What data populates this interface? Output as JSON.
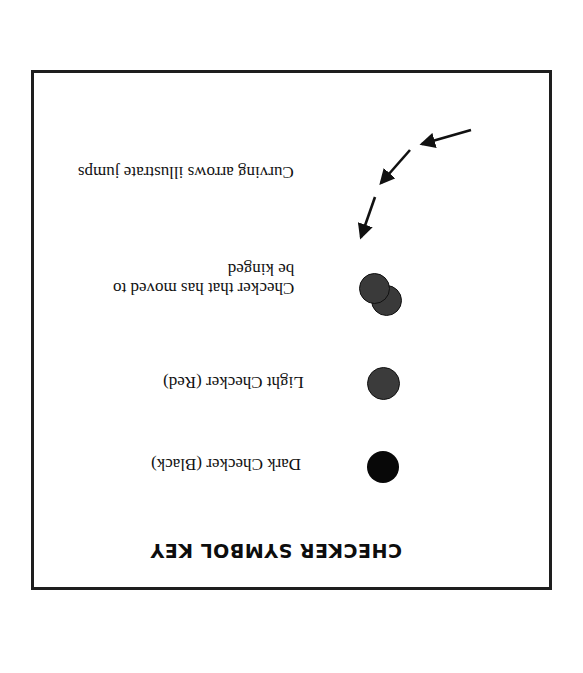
{
  "key": {
    "title": "CHECKER SYMBOL KEY",
    "orientation": "rotated 180 degrees",
    "items": [
      {
        "symbol": "dark-checker",
        "label": "Dark Checker (Black)",
        "color": "#080808"
      },
      {
        "symbol": "light-checker",
        "label": "Light Checker (Red)",
        "color": "#3b3b3b"
      },
      {
        "symbol": "kinged-checker",
        "label_line1": "Checker that has moved to",
        "label_line2": "be kinged",
        "color": "#3a3a3a"
      },
      {
        "symbol": "jump-arrows",
        "label": "Curving arrows illustrate jumps",
        "color": "#111111"
      }
    ]
  }
}
